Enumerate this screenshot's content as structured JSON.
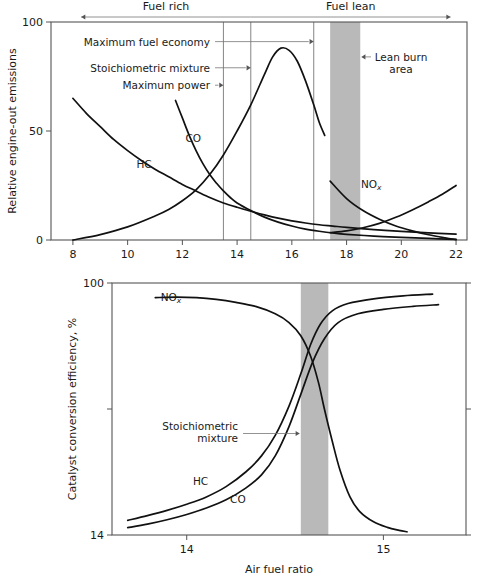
{
  "figure": {
    "title_hidden": "",
    "band_color": "#b9b9b9",
    "curve_color": "#111111",
    "frame_color": "#555555"
  },
  "chart_data": [
    {
      "type": "line",
      "id": "engine-out-emissions",
      "title": "",
      "xlabel": "",
      "ylabel": "Relative engine-out emissions",
      "xlim": [
        7.2,
        22.4
      ],
      "ylim": [
        0,
        100
      ],
      "xticks": [
        8,
        10,
        12,
        14,
        16,
        18,
        20,
        22
      ],
      "xtick_labels": [
        "8",
        "10",
        "12",
        "14",
        "16",
        "18",
        "20",
        "22"
      ],
      "yticks": [
        0,
        50,
        100
      ],
      "ytick_labels": [
        "0",
        "50",
        "100"
      ],
      "grid": false,
      "legend": "inline-curve-labels",
      "series": [
        {
          "name": "HC",
          "label": "HC",
          "label_at": [
            10.6,
            33
          ],
          "points": [
            [
              8.0,
              65
            ],
            [
              8.5,
              58
            ],
            [
              9.0,
              52
            ],
            [
              9.5,
              46
            ],
            [
              10.0,
              41
            ],
            [
              10.5,
              36.5
            ],
            [
              11.0,
              32.5
            ],
            [
              11.5,
              29
            ],
            [
              12.0,
              25.5
            ],
            [
              12.5,
              22.5
            ],
            [
              13.0,
              19.5
            ],
            [
              13.5,
              17
            ],
            [
              14.0,
              15
            ],
            [
              14.5,
              13.2
            ],
            [
              15.0,
              11.5
            ],
            [
              15.5,
              10
            ],
            [
              16.0,
              8.8
            ],
            [
              16.5,
              7.8
            ],
            [
              17.0,
              7
            ],
            [
              17.5,
              6.4
            ],
            [
              18.0,
              5.8
            ],
            [
              19.0,
              4.8
            ],
            [
              20.0,
              4.0
            ],
            [
              21.0,
              3.3
            ],
            [
              22.0,
              2.7
            ]
          ]
        },
        {
          "name": "CO",
          "label": "CO",
          "label_at": [
            12.4,
            45
          ],
          "points": [
            [
              11.75,
              64
            ],
            [
              12.0,
              56
            ],
            [
              12.25,
              48
            ],
            [
              12.5,
              41
            ],
            [
              12.75,
              35
            ],
            [
              13.0,
              30
            ],
            [
              13.25,
              26
            ],
            [
              13.5,
              22.5
            ],
            [
              13.75,
              19.5
            ],
            [
              14.0,
              17
            ],
            [
              14.5,
              13.5
            ],
            [
              15.0,
              10.5
            ],
            [
              15.5,
              8.2
            ],
            [
              16.0,
              6.4
            ],
            [
              16.5,
              5.0
            ],
            [
              17.0,
              4.0
            ],
            [
              17.5,
              3.2
            ],
            [
              18.0,
              2.6
            ],
            [
              19.0,
              1.8
            ],
            [
              20.0,
              1.2
            ],
            [
              21.0,
              0.7
            ],
            [
              22.0,
              0.3
            ]
          ]
        },
        {
          "name": "NOx-rise",
          "label": "",
          "label_at": null,
          "points": [
            [
              8.0,
              0
            ],
            [
              9.0,
              2.5
            ],
            [
              10.0,
              6
            ],
            [
              11.0,
              11
            ],
            [
              11.5,
              14
            ],
            [
              12.0,
              18
            ],
            [
              12.5,
              23
            ],
            [
              13.0,
              30
            ],
            [
              13.5,
              39
            ],
            [
              14.0,
              50
            ],
            [
              14.5,
              62
            ],
            [
              15.0,
              76
            ],
            [
              15.3,
              84
            ],
            [
              15.6,
              88
            ],
            [
              15.9,
              87
            ],
            [
              16.2,
              82
            ],
            [
              16.5,
              73
            ],
            [
              16.8,
              62
            ],
            [
              17.0,
              54
            ],
            [
              17.2,
              48
            ]
          ]
        },
        {
          "name": "NOx",
          "label": "NOx",
          "label_at": [
            19.1,
            24
          ],
          "points": [
            [
              17.4,
              27
            ],
            [
              18.0,
              19
            ],
            [
              18.6,
              13.5
            ],
            [
              19.2,
              9.5
            ],
            [
              19.8,
              6.4
            ],
            [
              20.4,
              4.2
            ],
            [
              21.0,
              2.4
            ],
            [
              21.6,
              1.0
            ],
            [
              22.0,
              0.2
            ]
          ]
        },
        {
          "name": "HC-lean-rise",
          "label": "",
          "label_at": null,
          "points": [
            [
              17.4,
              3.4
            ],
            [
              18.0,
              4.2
            ],
            [
              18.6,
              5.6
            ],
            [
              19.2,
              7.6
            ],
            [
              19.8,
              10.4
            ],
            [
              20.4,
              13.8
            ],
            [
              21.0,
              17.6
            ],
            [
              21.5,
              21
            ],
            [
              22.0,
              25
            ]
          ]
        }
      ],
      "vlines": [
        {
          "name": "Maximum power",
          "x": 13.5
        },
        {
          "name": "Stoichiometric mixture",
          "x": 14.5
        },
        {
          "name": "Maximum fuel economy",
          "x": 16.8
        }
      ],
      "band": {
        "name": "Lean burn area",
        "x0": 17.4,
        "x1": 18.5
      },
      "annotations": [
        {
          "name": "maximum-fuel-economy",
          "text": "Maximum fuel economy",
          "target_x": 16.8,
          "y": 91,
          "side": "left"
        },
        {
          "name": "stoichiometric-mixture",
          "text": "Stoichiometric mixture",
          "target_x": 14.5,
          "y": 79,
          "side": "left"
        },
        {
          "name": "maximum-power",
          "text": "Maximum power",
          "target_x": 13.5,
          "y": 71,
          "side": "left"
        },
        {
          "name": "lean-burn-area",
          "text": "Lean burn area",
          "text_line2": "area",
          "text_line1": "Lean burn",
          "target_x": 18.5,
          "y": 84,
          "side": "right"
        }
      ],
      "region_labels": [
        {
          "name": "fuel-rich",
          "text": "Fuel rich",
          "from_x": 14.5,
          "to_x": 8.3,
          "arrow": "left"
        },
        {
          "name": "fuel-lean",
          "text": "Fuel lean",
          "from_x": 14.5,
          "to_x": 21.8,
          "arrow": "right"
        }
      ]
    },
    {
      "type": "line",
      "id": "catalyst-conversion-efficiency",
      "title": "",
      "xlabel": "Air fuel ratio",
      "ylabel": "Catalyst conversion efficiency, %",
      "xlim": [
        13.62,
        15.42
      ],
      "ylim": [
        14,
        100
      ],
      "xticks": [
        14,
        15
      ],
      "xtick_labels": [
        "14",
        "15"
      ],
      "yticks": [
        14,
        57,
        100
      ],
      "ytick_labels": [
        "14",
        "",
        "100"
      ],
      "grid": false,
      "legend": "inline-curve-labels",
      "series": [
        {
          "name": "NOx",
          "label": "NOx",
          "label_at": [
            13.95,
            94
          ],
          "points": [
            [
              13.84,
              95
            ],
            [
              13.95,
              95.2
            ],
            [
              14.05,
              95
            ],
            [
              14.15,
              94.4
            ],
            [
              14.25,
              93.4
            ],
            [
              14.35,
              92
            ],
            [
              14.45,
              89.5
            ],
            [
              14.52,
              86.5
            ],
            [
              14.58,
              82
            ],
            [
              14.63,
              75
            ],
            [
              14.67,
              66
            ],
            [
              14.7,
              57
            ],
            [
              14.74,
              46
            ],
            [
              14.78,
              36
            ],
            [
              14.83,
              27
            ],
            [
              14.88,
              22
            ],
            [
              14.95,
              18.5
            ],
            [
              15.02,
              16.6
            ],
            [
              15.08,
              15.6
            ],
            [
              15.12,
              15.1
            ]
          ]
        },
        {
          "name": "HC",
          "label": "HC",
          "label_at": [
            14.08,
            31
          ],
          "points": [
            [
              13.7,
              19
            ],
            [
              13.8,
              20.6
            ],
            [
              13.9,
              22.4
            ],
            [
              14.0,
              24.5
            ],
            [
              14.1,
              27
            ],
            [
              14.2,
              30.5
            ],
            [
              14.3,
              35.5
            ],
            [
              14.38,
              41
            ],
            [
              14.45,
              48
            ],
            [
              14.52,
              58
            ],
            [
              14.58,
              69
            ],
            [
              14.63,
              79
            ],
            [
              14.68,
              86
            ],
            [
              14.74,
              90.5
            ],
            [
              14.82,
              93
            ],
            [
              14.95,
              94.6
            ],
            [
              15.1,
              95.6
            ],
            [
              15.25,
              96.2
            ]
          ]
        },
        {
          "name": "CO",
          "label": "CO",
          "label_at": [
            14.28,
            25
          ],
          "points": [
            [
              13.7,
              16.5
            ],
            [
              13.8,
              17.7
            ],
            [
              13.9,
              19.2
            ],
            [
              14.0,
              21
            ],
            [
              14.1,
              23.2
            ],
            [
              14.2,
              26
            ],
            [
              14.3,
              30
            ],
            [
              14.38,
              34.5
            ],
            [
              14.45,
              41
            ],
            [
              14.52,
              51
            ],
            [
              14.58,
              62
            ],
            [
              14.64,
              73
            ],
            [
              14.7,
              81
            ],
            [
              14.77,
              86.5
            ],
            [
              14.87,
              89.5
            ],
            [
              15.0,
              91
            ],
            [
              15.15,
              92
            ],
            [
              15.28,
              92.6
            ]
          ]
        }
      ],
      "band": {
        "name": "Stoichiometric band",
        "x0": 14.58,
        "x1": 14.72
      },
      "annotations": [
        {
          "name": "stoichiometric-mixture",
          "text_line1": "Stoichiometric",
          "text_line2": "mixture",
          "target_x": 14.58,
          "y": 50,
          "side": "left"
        }
      ]
    }
  ],
  "labels": {
    "fuel_rich": "Fuel rich",
    "fuel_lean": "Fuel lean",
    "lean_burn_line1": "Lean burn",
    "lean_burn_line2": "area",
    "max_fuel_economy": "Maximum fuel economy",
    "stoichiometric_mixture": "Stoichiometric mixture",
    "max_power": "Maximum power",
    "stoich_line1": "Stoichiometric",
    "stoich_line2": "mixture",
    "top_ylabel": "Relative engine-out emissions",
    "bottom_ylabel": "Catalyst conversion efficiency, %",
    "bottom_xlabel": "Air fuel ratio",
    "hc": "HC",
    "co": "CO",
    "nox_base": "NO",
    "nox_sub": "x"
  }
}
